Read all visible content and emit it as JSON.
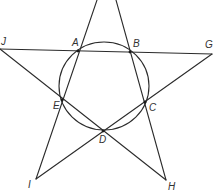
{
  "diagram": {
    "type": "star pentagram inscribed with circle",
    "stroke_color": "#2b2b2b",
    "background": "#ffffff",
    "circle": {
      "cx": 104,
      "cy": 86,
      "rx": 45,
      "ry": 44
    },
    "points": {
      "J": {
        "label": "J",
        "x": 0,
        "y": 49,
        "lx": 1,
        "ly": 37
      },
      "A": {
        "label": "A",
        "x": 78,
        "y": 51,
        "lx": 72,
        "ly": 38
      },
      "B": {
        "label": "B",
        "x": 130,
        "y": 52,
        "lx": 133,
        "ly": 39
      },
      "G": {
        "label": "G",
        "x": 212,
        "y": 54,
        "lx": 205,
        "ly": 40
      },
      "E": {
        "label": "E",
        "x": 62,
        "y": 100,
        "lx": 53,
        "ly": 101
      },
      "C": {
        "label": "C",
        "x": 145,
        "y": 102,
        "lx": 149,
        "ly": 103
      },
      "D": {
        "label": "D",
        "x": 103,
        "y": 131,
        "lx": 99,
        "ly": 135
      },
      "I": {
        "label": "I",
        "x": 36,
        "y": 179,
        "lx": 28,
        "ly": 180
      },
      "H": {
        "label": "H",
        "x": 166,
        "y": 180,
        "lx": 168,
        "ly": 182
      }
    },
    "segments": [
      {
        "from": "J",
        "to": "G",
        "x1": 0,
        "y1": 49,
        "x2": 212,
        "y2": 54
      },
      {
        "from": "J",
        "to": "H",
        "x1": 0,
        "y1": 49,
        "x2": 166,
        "y2": 180
      },
      {
        "from": "G",
        "to": "I",
        "x1": 212,
        "y1": 54,
        "x2": 36,
        "y2": 179
      },
      {
        "from": "top-left",
        "to": "I",
        "x1": 97,
        "y1": 0,
        "x2": 36,
        "y2": 179
      },
      {
        "from": "top-right",
        "to": "H",
        "x1": 116,
        "y1": 0,
        "x2": 166,
        "y2": 180
      }
    ],
    "labels": [
      "J",
      "A",
      "B",
      "G",
      "E",
      "C",
      "D",
      "I",
      "H"
    ]
  }
}
